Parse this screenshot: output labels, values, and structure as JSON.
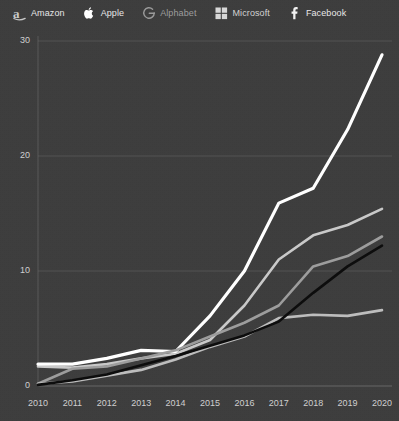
{
  "legend": {
    "items": [
      {
        "label": "Amazon",
        "icon": "amazon-logo-icon",
        "color": "#c8c8c8"
      },
      {
        "label": "Apple",
        "icon": "apple-logo-icon",
        "color": "#ffffff"
      },
      {
        "label": "Alphabet",
        "icon": "alphabet-logo-icon",
        "color": "#9a9a9a"
      },
      {
        "label": "Microsoft",
        "icon": "microsoft-logo-icon",
        "color": "#d8d8d8"
      },
      {
        "label": "Facebook",
        "icon": "facebook-logo-icon",
        "color": "#111111"
      }
    ]
  },
  "axes": {
    "y_ticks": [
      "0",
      "10",
      "20",
      "30"
    ],
    "x_ticks": [
      "2010",
      "2011",
      "2012",
      "2013",
      "2014",
      "2015",
      "2016",
      "2017",
      "2018",
      "2019",
      "2020"
    ]
  },
  "chart_data": {
    "type": "line",
    "title": "",
    "xlabel": "",
    "ylabel": "",
    "x": [
      2010,
      2011,
      2012,
      2013,
      2014,
      2015,
      2016,
      2017,
      2018,
      2019,
      2020
    ],
    "xlim": [
      2010,
      2020
    ],
    "ylim": [
      0,
      31
    ],
    "grid": true,
    "grid_axis": "y",
    "legend_position": "top-left",
    "series": [
      {
        "name": "Amazon",
        "color": "#c9c9c9",
        "width": 2.6,
        "values": [
          1.7,
          1.6,
          1.9,
          2.4,
          2.8,
          4.0,
          7.0,
          11.0,
          13.1,
          14.0,
          15.4
        ]
      },
      {
        "name": "Apple",
        "color": "#ffffff",
        "width": 3.2,
        "values": [
          1.9,
          1.9,
          2.4,
          3.1,
          3.0,
          6.1,
          10.0,
          15.9,
          17.2,
          22.3,
          28.8
        ]
      },
      {
        "name": "Alphabet",
        "color": "#9d9d9d",
        "width": 2.6,
        "values": [
          0.2,
          1.5,
          1.7,
          2.4,
          3.1,
          4.3,
          5.5,
          7.0,
          10.4,
          11.3,
          13.0
        ]
      },
      {
        "name": "Microsoft",
        "color": "#bdbdbd",
        "width": 2.6,
        "values": [
          0.2,
          0.4,
          0.9,
          1.4,
          2.3,
          3.4,
          4.3,
          5.9,
          6.2,
          6.1,
          6.6
        ]
      },
      {
        "name": "Facebook",
        "color": "#0d0d0d",
        "width": 2.6,
        "values": [
          0.1,
          0.5,
          1.0,
          1.8,
          2.6,
          3.5,
          4.4,
          5.6,
          8.1,
          10.4,
          12.2
        ]
      }
    ]
  }
}
